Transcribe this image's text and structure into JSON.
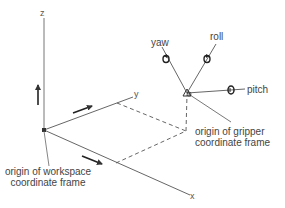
{
  "diagram": {
    "type": "coordinate-frames",
    "colors": {
      "line": "#555555",
      "text": "#444444",
      "background": "#ffffff"
    },
    "axes": {
      "x_label": "x",
      "y_label": "y",
      "z_label": "z"
    },
    "rotations": {
      "yaw_label": "yaw",
      "roll_label": "roll",
      "pitch_label": "pitch"
    },
    "annotations": {
      "workspace_origin_line1": "origin of workspace",
      "workspace_origin_line2": "coordinate frame",
      "gripper_origin_line1": "origin of gripper",
      "gripper_origin_line2": "coordinate frame"
    }
  }
}
